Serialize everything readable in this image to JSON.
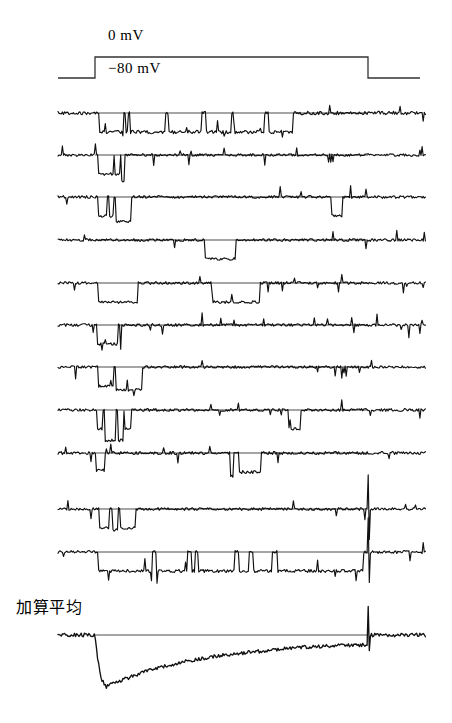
{
  "figure": {
    "ink_color": "#111111",
    "background_color": "#ffffff"
  },
  "protocol": {
    "holding_label": "−80 mV",
    "step_label": "0 mV",
    "holding_mv": -80,
    "step_mv": 0,
    "step_start_x": 95,
    "step_end_x": 368,
    "trace_start_x": 58,
    "trace_end_x": 426
  },
  "average": {
    "label": "加算平均"
  },
  "chart_data": {
    "type": "line",
    "xlabel": "",
    "ylabel": "",
    "grid": false,
    "legend": "none",
    "x_range": [
      0,
      1
    ],
    "annotations": [
      "0 mV",
      "−80 mV",
      "加算平均"
    ],
    "protocol_series": {
      "name": "voltage-command",
      "x": [
        0.0,
        0.1005,
        0.1005,
        0.8415,
        0.8415,
        1.0
      ],
      "y": [
        -80,
        -80,
        0,
        0,
        -80,
        -80
      ],
      "units": "mV"
    },
    "sweeps": [
      {
        "name": "sweep-1",
        "noise": 0.09,
        "openings": [
          [
            0.112,
            0.178,
            1.0
          ],
          [
            0.183,
            0.19,
            1.0
          ],
          [
            0.196,
            0.29,
            1.0
          ],
          [
            0.3,
            0.39,
            1.0
          ],
          [
            0.402,
            0.47,
            1.0
          ],
          [
            0.478,
            0.56,
            1.0
          ],
          [
            0.572,
            0.638,
            1.0
          ]
        ]
      },
      {
        "name": "sweep-2",
        "noise": 0.07,
        "openings": [
          [
            0.11,
            0.15,
            1.0
          ],
          [
            0.155,
            0.168,
            1.0
          ],
          [
            0.172,
            0.182,
            1.4
          ]
        ]
      },
      {
        "name": "sweep-3",
        "noise": 0.07,
        "openings": [
          [
            0.108,
            0.132,
            1.0
          ],
          [
            0.138,
            0.152,
            1.0
          ],
          [
            0.158,
            0.2,
            1.3
          ],
          [
            0.742,
            0.772,
            1.0
          ]
        ]
      },
      {
        "name": "sweep-4",
        "noise": 0.07,
        "openings": [
          [
            0.398,
            0.482,
            1.0
          ]
        ]
      },
      {
        "name": "sweep-5",
        "noise": 0.07,
        "openings": [
          [
            0.108,
            0.218,
            1.0
          ],
          [
            0.42,
            0.548,
            1.0
          ]
        ]
      },
      {
        "name": "sweep-6",
        "noise": 0.07,
        "openings": [
          [
            0.105,
            0.162,
            1.0
          ],
          [
            0.168,
            0.172,
            1.3
          ]
        ]
      },
      {
        "name": "sweep-7",
        "noise": 0.07,
        "openings": [
          [
            0.11,
            0.15,
            1.0
          ],
          [
            0.158,
            0.23,
            1.2
          ]
        ]
      },
      {
        "name": "sweep-8",
        "noise": 0.07,
        "openings": [
          [
            0.105,
            0.122,
            1.0
          ],
          [
            0.128,
            0.158,
            1.6
          ],
          [
            0.162,
            0.178,
            1.6
          ],
          [
            0.182,
            0.198,
            1.0
          ],
          [
            0.625,
            0.66,
            1.0
          ]
        ]
      },
      {
        "name": "sweep-9",
        "noise": 0.08,
        "openings": [
          [
            0.104,
            0.126,
            0.9
          ],
          [
            0.468,
            0.478,
            1.2
          ],
          [
            0.492,
            0.55,
            1.0
          ]
        ]
      },
      {
        "name": "sweep-10",
        "noise": 0.07,
        "openings": [
          [
            0.112,
            0.14,
            1.0
          ],
          [
            0.148,
            0.162,
            1.1
          ],
          [
            0.168,
            0.212,
            1.0
          ]
        ],
        "tail_transient": true
      },
      {
        "name": "sweep-11",
        "noise": 0.08,
        "openings": [
          [
            0.108,
            0.255,
            1.0
          ],
          [
            0.268,
            0.352,
            1.0
          ],
          [
            0.362,
            0.372,
            1.0
          ],
          [
            0.382,
            0.48,
            1.0
          ],
          [
            0.492,
            0.52,
            1.0
          ],
          [
            0.532,
            0.58,
            1.0
          ],
          [
            0.596,
            0.83,
            1.0
          ]
        ],
        "tail_transient": true
      }
    ],
    "ensemble_average": {
      "name": "加算平均",
      "peak_x": 0.13,
      "peak_amplitude": 1.0,
      "decay": "slow monotonic return toward baseline",
      "x": [
        0.0,
        0.1,
        0.105,
        0.115,
        0.13,
        0.15,
        0.175,
        0.2,
        0.23,
        0.26,
        0.3,
        0.34,
        0.38,
        0.42,
        0.46,
        0.5,
        0.55,
        0.6,
        0.65,
        0.7,
        0.75,
        0.8,
        0.84,
        0.845,
        0.9,
        1.0
      ],
      "y": [
        0.0,
        0.0,
        -0.3,
        -0.8,
        -1.0,
        -0.93,
        -0.86,
        -0.8,
        -0.72,
        -0.66,
        -0.58,
        -0.52,
        -0.46,
        -0.42,
        -0.38,
        -0.35,
        -0.31,
        -0.27,
        -0.24,
        -0.22,
        -0.21,
        -0.2,
        -0.19,
        0.0,
        0.0,
        0.0
      ]
    }
  }
}
